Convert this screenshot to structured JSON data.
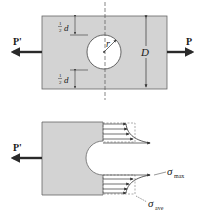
{
  "figure": {
    "top": {
      "load_left_label": "P'",
      "load_right_label": "P",
      "radius_label": "r",
      "width_label": "D",
      "half_d_top": {
        "fraction_num": "1",
        "fraction_den": "2",
        "var": "d"
      },
      "half_d_bottom": {
        "fraction_num": "1",
        "fraction_den": "2",
        "var": "d"
      }
    },
    "bottom": {
      "load_left_label": "P'",
      "sigma_max": {
        "symbol": "σ",
        "subscript": "max"
      },
      "sigma_ave": {
        "symbol": "σ",
        "subscript": "ave"
      }
    }
  },
  "colors": {
    "plate_fill": "#d3d3d3",
    "line": "#333333",
    "arrow": "#2a2a2a",
    "background": "#ffffff"
  }
}
